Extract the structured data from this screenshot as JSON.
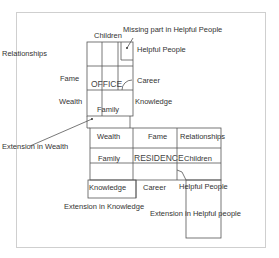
{
  "diagram": {
    "office": {
      "title": "OFFICE",
      "labels": {
        "children": "Children",
        "missing": "Missing part in Helpful People",
        "relationships": "Relationships",
        "helpful_people": "Helpful People",
        "fame": "Fame",
        "career": "Career",
        "wealth": "Wealth",
        "knowledge": "Knowledge",
        "family": "Family",
        "extension_wealth": "Extension in Wealth"
      }
    },
    "residence": {
      "title": "RESIDENCE",
      "labels": {
        "wealth": "Wealth",
        "fame": "Fame",
        "relationships": "Relationships",
        "family": "Family",
        "children": "Children",
        "knowledge": "Knowledge",
        "career": "Career",
        "helpful_people": "Helpful People",
        "extension_knowledge": "Extension in Knowledge",
        "extension_helpful": "Extension in Helpful people"
      }
    }
  }
}
